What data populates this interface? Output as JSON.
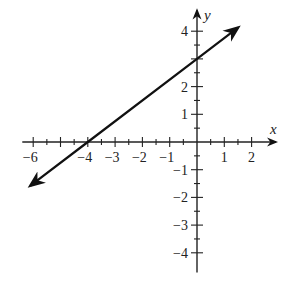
{
  "chart_data": {
    "type": "line",
    "title": "",
    "xlabel": "x",
    "ylabel": "y",
    "xlim": [
      -6.4,
      2.6
    ],
    "ylim": [
      -4.6,
      4.6
    ],
    "grid": false,
    "legend": null,
    "x_ticks": [
      -6,
      -4,
      -3,
      -2,
      -1,
      1,
      2
    ],
    "x_minor_step": 0.5,
    "y_ticks": [
      -4,
      -3,
      -2,
      -1,
      1,
      2,
      4
    ],
    "y_minor_step": 0.5,
    "series": [
      {
        "name": "line",
        "equation": "y = 0.75x + 3",
        "slope": 0.75,
        "intercept": 3,
        "x": [
          -6.1,
          -4,
          0,
          1.5
        ],
        "y": [
          -1.575,
          0,
          3,
          4.125
        ],
        "arrows": "both",
        "color": "#111111"
      }
    ],
    "annotations": {
      "x_intercept": [
        -4,
        0
      ],
      "y_intercept": [
        0,
        3
      ]
    }
  },
  "layout": {
    "origin_px": [
      197,
      142
    ],
    "unit_x_px": 27.3,
    "unit_y_px": 27.7,
    "axis_color": "#222222"
  }
}
